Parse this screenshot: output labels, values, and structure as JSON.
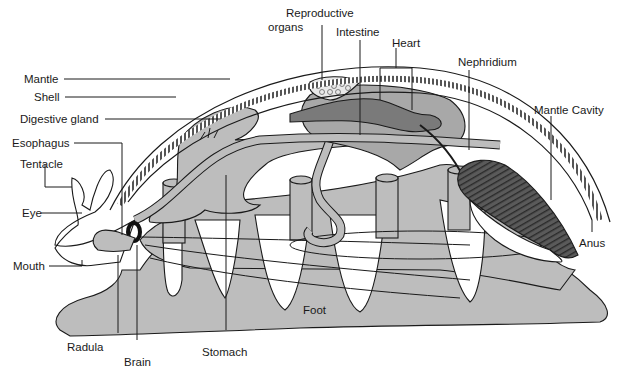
{
  "diagram": {
    "colors": {
      "background": "#ffffff",
      "tissue_light": "#bdbdbd",
      "tissue_mid": "#a8a8a8",
      "heart_dark": "#7a7a7a",
      "gill_dark": "#4a4a4a",
      "outline": "#1a1a1a"
    },
    "labels": {
      "reproductive_organs_1": "Reproductive",
      "reproductive_organs_2": "organs",
      "intestine": "Intestine",
      "heart": "Heart",
      "nephridium": "Nephridium",
      "mantle_cavity": "Mantle Cavity",
      "mantle": "Mantle",
      "shell": "Shell",
      "digestive_gland": "Digestive gland",
      "esophagus": "Esophagus",
      "tentacle": "Tentacle",
      "eye": "Eye",
      "mouth": "Mouth",
      "radula": "Radula",
      "brain": "Brain",
      "stomach": "Stomach",
      "foot": "Foot",
      "anus": "Anus"
    }
  }
}
